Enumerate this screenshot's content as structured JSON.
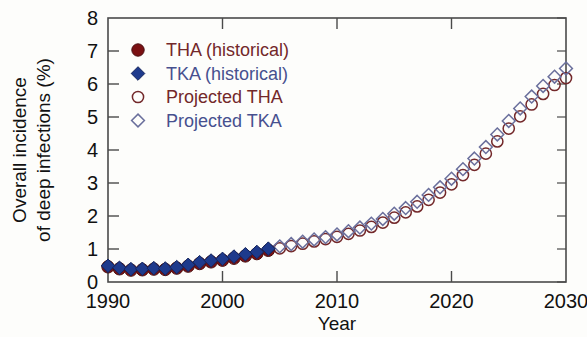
{
  "chart_data": {
    "type": "scatter",
    "title": "",
    "xlabel": "Year",
    "ylabel": "Overall incidence of deep infections (%)",
    "ylabel_line1": "Overall incidence",
    "ylabel_line2": "of deep infections (%)",
    "xlim": [
      1990,
      2030
    ],
    "ylim": [
      0,
      8
    ],
    "xticks": [
      1990,
      2000,
      2010,
      2020,
      2030
    ],
    "xtick_labels": [
      "1990",
      "2000",
      "2010",
      "2020",
      "2030"
    ],
    "xticks_minor": [
      1995,
      2005,
      2015,
      2025
    ],
    "yticks": [
      0,
      1,
      2,
      3,
      4,
      5,
      6,
      7,
      8
    ],
    "ytick_labels": [
      "0",
      "1",
      "2",
      "3",
      "4",
      "5",
      "6",
      "7",
      "8"
    ],
    "grid": false,
    "legend_position": "upper-left-inside",
    "series": [
      {
        "name": "THA (historical)",
        "marker": "filled-circle",
        "color": "#7a1012",
        "x": [
          1990,
          1991,
          1992,
          1993,
          1994,
          1995,
          1996,
          1997,
          1998,
          1999,
          2000,
          2001,
          2002,
          2003,
          2004
        ],
        "values": [
          0.46,
          0.4,
          0.36,
          0.37,
          0.39,
          0.38,
          0.42,
          0.48,
          0.56,
          0.61,
          0.66,
          0.72,
          0.79,
          0.86,
          0.96
        ]
      },
      {
        "name": "TKA (historical)",
        "marker": "filled-diamond",
        "color": "#1e3a8c",
        "x": [
          1990,
          1991,
          1992,
          1993,
          1994,
          1995,
          1996,
          1997,
          1998,
          1999,
          2000,
          2001,
          2002,
          2003,
          2004
        ],
        "values": [
          0.49,
          0.43,
          0.39,
          0.4,
          0.42,
          0.41,
          0.45,
          0.52,
          0.6,
          0.65,
          0.7,
          0.77,
          0.84,
          0.91,
          1.01
        ]
      },
      {
        "name": "Projected THA",
        "marker": "open-circle",
        "color": "#73282a",
        "x": [
          2005,
          2006,
          2007,
          2008,
          2009,
          2010,
          2011,
          2012,
          2013,
          2014,
          2015,
          2016,
          2017,
          2018,
          2019,
          2020,
          2021,
          2022,
          2023,
          2024,
          2025,
          2026,
          2027,
          2028,
          2029,
          2030
        ],
        "values": [
          1.02,
          1.09,
          1.16,
          1.23,
          1.3,
          1.37,
          1.46,
          1.56,
          1.67,
          1.8,
          1.95,
          2.11,
          2.29,
          2.49,
          2.71,
          2.96,
          3.24,
          3.55,
          3.89,
          4.26,
          4.65,
          5.02,
          5.38,
          5.7,
          5.97,
          6.18
        ]
      },
      {
        "name": "Projected TKA",
        "marker": "open-diamond",
        "color": "#6a6f9c",
        "x": [
          2005,
          2006,
          2007,
          2008,
          2009,
          2010,
          2011,
          2012,
          2013,
          2014,
          2015,
          2016,
          2017,
          2018,
          2019,
          2020,
          2021,
          2022,
          2023,
          2024,
          2025,
          2026,
          2027,
          2028,
          2029,
          2030
        ],
        "values": [
          1.08,
          1.15,
          1.22,
          1.29,
          1.36,
          1.44,
          1.54,
          1.65,
          1.77,
          1.91,
          2.07,
          2.24,
          2.43,
          2.64,
          2.87,
          3.13,
          3.42,
          3.74,
          4.09,
          4.47,
          4.88,
          5.26,
          5.62,
          5.94,
          6.22,
          6.47
        ]
      }
    ]
  },
  "legend": {
    "entries": [
      {
        "label": "THA (historical)",
        "marker": "filled-circle",
        "color": "#7a1012",
        "text_color": "#73282a"
      },
      {
        "label": "TKA (historical)",
        "marker": "filled-diamond",
        "color": "#1e3a8c",
        "text_color": "#47508f"
      },
      {
        "label": "Projected THA",
        "marker": "open-circle",
        "color": "#73282a",
        "text_color": "#73282a"
      },
      {
        "label": "Projected TKA",
        "marker": "open-diamond",
        "color": "#6a6f9c",
        "text_color": "#47508f"
      }
    ]
  },
  "colors": {
    "tha_fill": "#7a1012",
    "tka_fill": "#1e3a8c",
    "tha_outline": "#73282a",
    "tka_outline": "#6a6f9c",
    "axis": "#4a4a4a",
    "text": "#111111",
    "background": "#fdfdfb"
  }
}
